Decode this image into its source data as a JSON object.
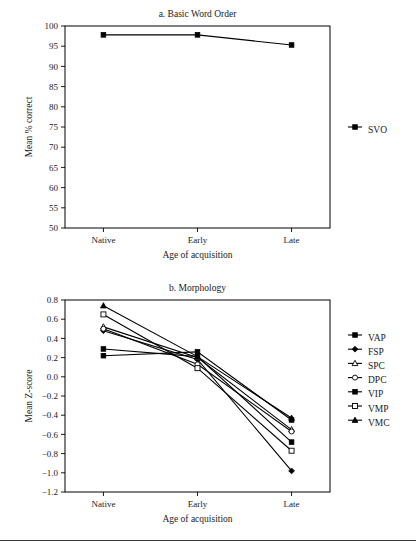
{
  "figure": {
    "background": "#ffffff",
    "ink": "#000000"
  },
  "chart_data": [
    {
      "type": "line",
      "title": "a. Basic Word Order",
      "xlabel": "Age of acquisition",
      "ylabel": "Mean % correct",
      "categories": [
        "Native",
        "Early",
        "Late"
      ],
      "ylim": [
        50,
        100
      ],
      "yticks": [
        50,
        55,
        60,
        65,
        70,
        75,
        80,
        85,
        90,
        95,
        100
      ],
      "ytick_labels": [
        "50",
        "55",
        "60",
        "65",
        "70",
        "75",
        "80",
        "85",
        "90",
        "95",
        "100"
      ],
      "grid": false,
      "legend_position": "right",
      "series": [
        {
          "name": "SVO",
          "marker": "filled-square",
          "values": [
            97.8,
            97.8,
            95.3
          ]
        }
      ]
    },
    {
      "type": "line",
      "title": "b. Morphology",
      "xlabel": "Age of acquisition",
      "ylabel": "Mean Z-score",
      "categories": [
        "Native",
        "Early",
        "Late"
      ],
      "ylim": [
        -1.2,
        0.8
      ],
      "yticks": [
        0.8,
        0.6,
        0.4,
        0.2,
        0.0,
        -0.2,
        -0.4,
        -0.6,
        -0.8,
        -1.0,
        -1.2
      ],
      "ytick_labels": [
        "0.8",
        "0.6",
        "0.4",
        "0.2",
        "0.0",
        "−0.2",
        "−0.4",
        "−0.6",
        "−0.8",
        "−1.0",
        "−1.2"
      ],
      "grid": false,
      "legend_position": "right",
      "series": [
        {
          "name": "VAP",
          "marker": "filled-square",
          "values": [
            0.22,
            0.26,
            -0.45
          ]
        },
        {
          "name": "FSP",
          "marker": "filled-diamond",
          "values": [
            0.48,
            0.18,
            -0.98
          ]
        },
        {
          "name": "SPC",
          "marker": "open-triangle",
          "values": [
            0.52,
            0.2,
            -0.55
          ]
        },
        {
          "name": "DPC",
          "marker": "open-circle",
          "values": [
            0.5,
            0.13,
            -0.57
          ]
        },
        {
          "name": "VIP",
          "marker": "filled-square",
          "values": [
            0.29,
            0.21,
            -0.68
          ]
        },
        {
          "name": "VMP",
          "marker": "open-square",
          "values": [
            0.65,
            0.09,
            -0.77
          ]
        },
        {
          "name": "VMC",
          "marker": "filled-triangle",
          "values": [
            0.74,
            0.21,
            -0.43
          ]
        }
      ]
    }
  ]
}
